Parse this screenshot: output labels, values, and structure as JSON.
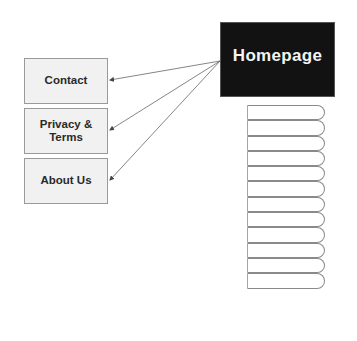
{
  "diagram": {
    "type": "sitemap",
    "root": {
      "label": "Homepage",
      "fill": "#121212",
      "text_color": "#f4f4f4"
    },
    "linked_pages": [
      {
        "label": "Contact"
      },
      {
        "label": "Privacy & Terms"
      },
      {
        "label": "About Us"
      }
    ],
    "edges": [
      {
        "from": "Homepage",
        "to": "Contact",
        "arrow": "end"
      },
      {
        "from": "Homepage",
        "to": "Privacy & Terms",
        "arrow": "end"
      },
      {
        "from": "Homepage",
        "to": "About Us",
        "arrow": "end"
      }
    ],
    "tab_stack": {
      "count": 12,
      "labels": [
        "",
        "",
        "",
        "",
        "",
        "",
        "",
        "",
        "",
        "",
        "",
        ""
      ]
    },
    "colors": {
      "page_fill": "#f1f1f1",
      "page_border": "#9a9a9a",
      "edge": "#666666"
    }
  }
}
